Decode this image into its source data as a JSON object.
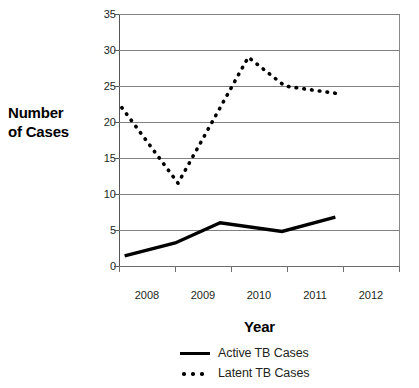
{
  "chart_data": {
    "type": "line",
    "title": "",
    "xlabel": "Year",
    "ylabel": "Number of Cases",
    "ylabel_lines": [
      "Number",
      "of Cases"
    ],
    "categories": [
      "2008",
      "2009",
      "2010",
      "2011",
      "2012"
    ],
    "ylim": [
      0,
      35
    ],
    "yticks": [
      0,
      5,
      10,
      15,
      20,
      25,
      30,
      35
    ],
    "ytick_labels": [
      "0",
      "5",
      "10",
      "15",
      "20",
      "25",
      "30",
      "35"
    ],
    "grid": true,
    "legend_position": "bottom",
    "series": [
      {
        "name": "Active TB Cases",
        "style": "solid",
        "color": "#000000",
        "values": [
          1.4,
          3.2,
          6.0,
          4.8,
          6.8
        ],
        "points": [
          {
            "x": 2008.1,
            "y": 1.4
          },
          {
            "x": 2009.0,
            "y": 3.2
          },
          {
            "x": 2009.8,
            "y": 6.0
          },
          {
            "x": 2010.9,
            "y": 4.8
          },
          {
            "x": 2011.85,
            "y": 6.8
          }
        ]
      },
      {
        "name": "Latent TB Cases",
        "style": "dotted",
        "color": "#000000",
        "values": [
          22.0,
          11.5,
          25.0,
          24.8,
          24.0
        ],
        "points": [
          {
            "x": 2008.05,
            "y": 22.0
          },
          {
            "x": 2009.05,
            "y": 11.5
          },
          {
            "x": 2010.3,
            "y": 29.0
          },
          {
            "x": 2010.95,
            "y": 25.0
          },
          {
            "x": 2011.3,
            "y": 24.6
          },
          {
            "x": 2011.85,
            "y": 24.0
          }
        ]
      }
    ],
    "annotations": {
      "latent_start": 22,
      "latent_min": 11.5,
      "latent_peak": 29,
      "latent_end": 24,
      "active_start": 1.4,
      "active_peak": 6,
      "active_dip": 4.8,
      "active_end": 6.8
    }
  },
  "legend": {
    "items": [
      {
        "label": "Active TB Cases",
        "style": "solid"
      },
      {
        "label": "Latent TB Cases",
        "style": "dotted"
      }
    ]
  }
}
